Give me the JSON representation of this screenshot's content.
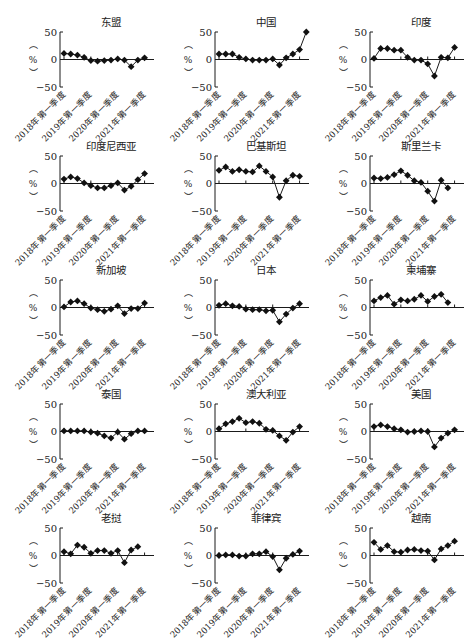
{
  "chart_data": [
    {
      "type": "line",
      "title": "东盟",
      "ylabel": "（%）",
      "ylim": [
        -50,
        50
      ],
      "yticks": [
        50,
        0,
        -50
      ],
      "categories": [
        "2018Q1",
        "2018Q2",
        "2018Q3",
        "2018Q4",
        "2019Q1",
        "2019Q2",
        "2019Q3",
        "2019Q4",
        "2020Q1",
        "2020Q2",
        "2020Q3",
        "2020Q4",
        "2021Q1",
        "2021Q2"
      ],
      "xtick_labels": [
        "2018年第一季度",
        "2019年第一季度",
        "2020年第一季度",
        "2021年第一季度"
      ],
      "values": [
        11,
        10,
        8,
        4,
        -2,
        -3,
        -2,
        -1,
        1,
        -1,
        -13,
        -1,
        3,
        null
      ]
    },
    {
      "type": "line",
      "title": "中国",
      "ylabel": "（%）",
      "ylim": [
        -50,
        50
      ],
      "yticks": [
        50,
        0,
        -50
      ],
      "categories": [
        "2018Q1",
        "2018Q2",
        "2018Q3",
        "2018Q4",
        "2019Q1",
        "2019Q2",
        "2019Q3",
        "2019Q4",
        "2020Q1",
        "2020Q2",
        "2020Q3",
        "2020Q4",
        "2021Q1",
        "2021Q2"
      ],
      "xtick_labels": [
        "2018年第一季度",
        "2019年第一季度",
        "2020年第一季度",
        "2021年第一季度"
      ],
      "values": [
        10,
        10,
        10,
        4,
        1,
        -1,
        -1,
        -1,
        1,
        -10,
        3,
        10,
        18,
        50
      ]
    },
    {
      "type": "line",
      "title": "印度",
      "ylabel": "（%）",
      "ylim": [
        -50,
        50
      ],
      "yticks": [
        50,
        0,
        -50
      ],
      "categories": [
        "2018Q1",
        "2018Q2",
        "2018Q3",
        "2018Q4",
        "2019Q1",
        "2019Q2",
        "2019Q3",
        "2019Q4",
        "2020Q1",
        "2020Q2",
        "2020Q3",
        "2020Q4",
        "2021Q1",
        "2021Q2"
      ],
      "xtick_labels": [
        "2018年第一季度",
        "2019年第一季度",
        "2020年第一季度",
        "2021年第一季度"
      ],
      "values": [
        2,
        20,
        20,
        17,
        17,
        4,
        -1,
        -1,
        -8,
        -30,
        4,
        3,
        22,
        null
      ]
    },
    {
      "type": "line",
      "title": "印度尼西亚",
      "ylabel": "（%）",
      "ylim": [
        -50,
        50
      ],
      "yticks": [
        50,
        0,
        -50
      ],
      "categories": [
        "2018Q1",
        "2018Q2",
        "2018Q3",
        "2018Q4",
        "2019Q1",
        "2019Q2",
        "2019Q3",
        "2019Q4",
        "2020Q1",
        "2020Q2",
        "2020Q3",
        "2020Q4",
        "2021Q1",
        "2021Q2"
      ],
      "xtick_labels": [
        "2018年第一季度",
        "2019年第一季度",
        "2020年第一季度",
        "2021年第一季度"
      ],
      "values": [
        8,
        12,
        9,
        1,
        -4,
        -8,
        -8,
        -4,
        1,
        -12,
        -5,
        7,
        18,
        null
      ]
    },
    {
      "type": "line",
      "title": "巴基斯坦",
      "ylabel": "（%）",
      "ylim": [
        -50,
        50
      ],
      "yticks": [
        50,
        0,
        -50
      ],
      "categories": [
        "2018Q1",
        "2018Q2",
        "2018Q3",
        "2018Q4",
        "2019Q1",
        "2019Q2",
        "2019Q3",
        "2019Q4",
        "2020Q1",
        "2020Q2",
        "2020Q3",
        "2020Q4",
        "2021Q1",
        "2021Q2"
      ],
      "xtick_labels": [
        "2018年第一季度",
        "2019年第一季度",
        "2020年第一季度",
        "2021年第一季度"
      ],
      "values": [
        24,
        30,
        22,
        25,
        22,
        21,
        32,
        22,
        12,
        -25,
        5,
        15,
        13,
        null
      ]
    },
    {
      "type": "line",
      "title": "斯里兰卡",
      "ylabel": "（%）",
      "ylim": [
        -50,
        50
      ],
      "yticks": [
        50,
        0,
        -50
      ],
      "categories": [
        "2018Q1",
        "2018Q2",
        "2018Q3",
        "2018Q4",
        "2019Q1",
        "2019Q2",
        "2019Q3",
        "2019Q4",
        "2020Q1",
        "2020Q2",
        "2020Q3",
        "2020Q4",
        "2021Q1",
        "2021Q2"
      ],
      "xtick_labels": [
        "2018年第一季度",
        "2019年第一季度",
        "2020年第一季度",
        "2021年第一季度"
      ],
      "values": [
        10,
        9,
        11,
        16,
        23,
        15,
        5,
        2,
        -14,
        -32,
        6,
        -8,
        null,
        null
      ]
    },
    {
      "type": "line",
      "title": "新加坡",
      "ylabel": "（%）",
      "ylim": [
        -50,
        50
      ],
      "yticks": [
        50,
        0,
        -50
      ],
      "categories": [
        "2018Q1",
        "2018Q2",
        "2018Q3",
        "2018Q4",
        "2019Q1",
        "2019Q2",
        "2019Q3",
        "2019Q4",
        "2020Q1",
        "2020Q2",
        "2020Q3",
        "2020Q4",
        "2021Q1",
        "2021Q2"
      ],
      "xtick_labels": [
        "2018年第一季度",
        "2019年第一季度",
        "2020年第一季度",
        "2021年第一季度"
      ],
      "values": [
        1,
        10,
        12,
        7,
        -1,
        -4,
        -7,
        -3,
        3,
        -11,
        -2,
        -2,
        8,
        null
      ]
    },
    {
      "type": "line",
      "title": "日本",
      "ylabel": "（%）",
      "ylim": [
        -50,
        50
      ],
      "yticks": [
        50,
        0,
        -50
      ],
      "categories": [
        "2018Q1",
        "2018Q2",
        "2018Q3",
        "2018Q4",
        "2019Q1",
        "2019Q2",
        "2019Q3",
        "2019Q4",
        "2020Q1",
        "2020Q2",
        "2020Q3",
        "2020Q4",
        "2021Q1",
        "2021Q2"
      ],
      "xtick_labels": [
        "2018年第一季度",
        "2019年第一季度",
        "2020年第一季度",
        "2021年第一季度"
      ],
      "values": [
        4,
        7,
        3,
        2,
        -3,
        -4,
        -4,
        -6,
        -5,
        -26,
        -12,
        -1,
        7,
        null
      ]
    },
    {
      "type": "line",
      "title": "柬埔寨",
      "ylabel": "（%）",
      "ylim": [
        -50,
        50
      ],
      "yticks": [
        50,
        0,
        -50
      ],
      "categories": [
        "2018Q1",
        "2018Q2",
        "2018Q3",
        "2018Q4",
        "2019Q1",
        "2019Q2",
        "2019Q3",
        "2019Q4",
        "2020Q1",
        "2020Q2",
        "2020Q3",
        "2020Q4",
        "2021Q1",
        "2021Q2"
      ],
      "xtick_labels": [
        "2018年第一季度",
        "2019年第一季度",
        "2020年第一季度",
        "2021年第一季度"
      ],
      "values": [
        12,
        18,
        22,
        6,
        14,
        12,
        15,
        22,
        11,
        20,
        24,
        9,
        null,
        null
      ]
    },
    {
      "type": "line",
      "title": "泰国",
      "ylabel": "（%）",
      "ylim": [
        -50,
        50
      ],
      "yticks": [
        50,
        0,
        -50
      ],
      "categories": [
        "2018Q1",
        "2018Q2",
        "2018Q3",
        "2018Q4",
        "2019Q1",
        "2019Q2",
        "2019Q3",
        "2019Q4",
        "2020Q1",
        "2020Q2",
        "2020Q3",
        "2020Q4",
        "2021Q1",
        "2021Q2"
      ],
      "xtick_labels": [
        "2018年第一季度",
        "2019年第一季度",
        "2020年第一季度",
        "2021年第一季度"
      ],
      "values": [
        1,
        1,
        1,
        1,
        -1,
        -3,
        -8,
        -12,
        -1,
        -14,
        -4,
        1,
        1,
        null
      ]
    },
    {
      "type": "line",
      "title": "澳大利亚",
      "ylabel": "（%）",
      "ylim": [
        -50,
        50
      ],
      "yticks": [
        50,
        0,
        -50
      ],
      "categories": [
        "2018Q1",
        "2018Q2",
        "2018Q3",
        "2018Q4",
        "2019Q1",
        "2019Q2",
        "2019Q3",
        "2019Q4",
        "2020Q1",
        "2020Q2",
        "2020Q3",
        "2020Q4",
        "2021Q1",
        "2021Q2"
      ],
      "xtick_labels": [
        "2018年第一季度",
        "2019年第一季度",
        "2020年第一季度",
        "2021年第一季度"
      ],
      "values": [
        5,
        14,
        18,
        24,
        16,
        18,
        15,
        4,
        2,
        -8,
        -16,
        -1,
        9,
        null
      ]
    },
    {
      "type": "line",
      "title": "美国",
      "ylabel": "（%）",
      "ylim": [
        -50,
        50
      ],
      "yticks": [
        50,
        0,
        -50
      ],
      "categories": [
        "2018Q1",
        "2018Q2",
        "2018Q3",
        "2018Q4",
        "2019Q1",
        "2019Q2",
        "2019Q3",
        "2019Q4",
        "2020Q1",
        "2020Q2",
        "2020Q3",
        "2020Q4",
        "2021Q1",
        "2021Q2"
      ],
      "xtick_labels": [
        "2018年第一季度",
        "2019年第一季度",
        "2020年第一季度",
        "2021年第一季度"
      ],
      "values": [
        9,
        12,
        9,
        5,
        3,
        -1,
        0,
        1,
        0,
        -28,
        -12,
        -3,
        3,
        null
      ]
    },
    {
      "type": "line",
      "title": "老挝",
      "ylabel": "（%）",
      "ylim": [
        -50,
        50
      ],
      "yticks": [
        50,
        0,
        -50
      ],
      "categories": [
        "2018Q1",
        "2018Q2",
        "2018Q3",
        "2018Q4",
        "2019Q1",
        "2019Q2",
        "2019Q3",
        "2019Q4",
        "2020Q1",
        "2020Q2",
        "2020Q3",
        "2020Q4",
        "2021Q1",
        "2021Q2"
      ],
      "xtick_labels": [
        "2018年第一季度",
        "2019年第一季度",
        "2020年第一季度",
        "2021年第一季度"
      ],
      "values": [
        7,
        3,
        19,
        15,
        4,
        9,
        9,
        4,
        9,
        -13,
        10,
        16,
        null,
        null
      ]
    },
    {
      "type": "line",
      "title": "菲律宾",
      "ylabel": "（%）",
      "ylim": [
        -50,
        50
      ],
      "yticks": [
        50,
        0,
        -50
      ],
      "categories": [
        "2018Q1",
        "2018Q2",
        "2018Q3",
        "2018Q4",
        "2019Q1",
        "2019Q2",
        "2019Q3",
        "2019Q4",
        "2020Q1",
        "2020Q2",
        "2020Q3",
        "2020Q4",
        "2021Q1",
        "2021Q2"
      ],
      "xtick_labels": [
        "2018年第一季度",
        "2019年第一季度",
        "2020年第一季度",
        "2021年第一季度"
      ],
      "values": [
        0,
        1,
        1,
        -1,
        -1,
        3,
        3,
        7,
        -2,
        -26,
        -5,
        2,
        8,
        null
      ]
    },
    {
      "type": "line",
      "title": "越南",
      "ylabel": "（%）",
      "ylim": [
        -50,
        50
      ],
      "yticks": [
        50,
        0,
        -50
      ],
      "categories": [
        "2018Q1",
        "2018Q2",
        "2018Q3",
        "2018Q4",
        "2019Q1",
        "2019Q2",
        "2019Q3",
        "2019Q4",
        "2020Q1",
        "2020Q2",
        "2020Q3",
        "2020Q4",
        "2021Q1",
        "2021Q2"
      ],
      "xtick_labels": [
        "2018年第一季度",
        "2019年第一季度",
        "2020年第一季度",
        "2021年第一季度"
      ],
      "values": [
        24,
        11,
        18,
        7,
        6,
        10,
        11,
        9,
        8,
        -8,
        12,
        18,
        26,
        null
      ]
    }
  ],
  "layout": {
    "columns": 3,
    "rows": 5,
    "marker": "diamond",
    "line_color": "#1a1a1a"
  }
}
